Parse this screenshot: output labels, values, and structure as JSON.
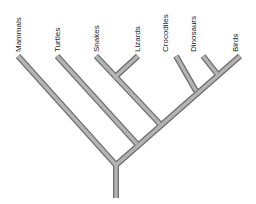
{
  "diagram": {
    "type": "cladogram",
    "taxa": [
      {
        "label": "Mammals",
        "tip": [
          18,
          56
        ]
      },
      {
        "label": "Turtles",
        "tip": [
          57,
          56
        ]
      },
      {
        "label": "Snakes",
        "tip": [
          96,
          56
        ]
      },
      {
        "label": "Lizards",
        "tip": [
          138,
          56
        ]
      },
      {
        "label": "Crocodiles",
        "tip": [
          176,
          56
        ]
      },
      {
        "label": "Dinosaurs",
        "tip": [
          203,
          56
        ]
      },
      {
        "label": "Birds",
        "tip": [
          240,
          56
        ]
      }
    ],
    "colors": {
      "branch_outline": "#6e6e6e",
      "branch_fill": "#b4b4b4",
      "label": "#222222",
      "background": "#ffffff"
    }
  }
}
